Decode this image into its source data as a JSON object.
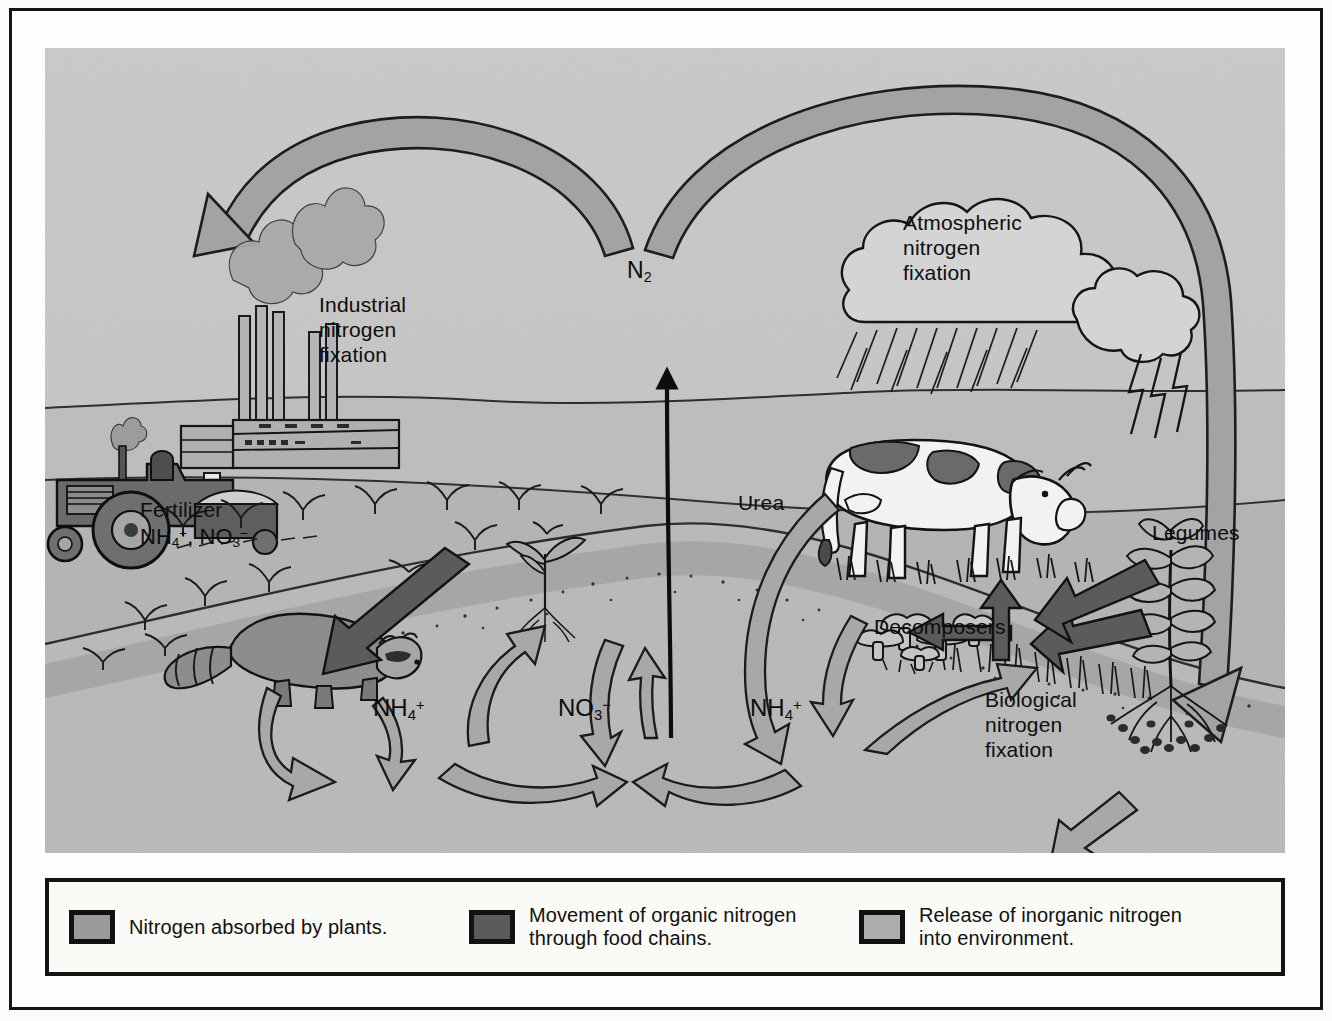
{
  "figure": {
    "type": "diagram"
  },
  "illustration": {
    "labels": {
      "industrial_fixation": "Industrial\nnitrogen\nfixation",
      "atmospheric_fixation": "Atmospheric\nnitrogen\nfixation",
      "biological_fixation": "Biological\nnitrogen\nfixation",
      "fertilizer_title": "Fertilizer",
      "fertilizer_formula_ammonium": "NH",
      "fertilizer_formula_nitrate": "NO",
      "urea": "Urea",
      "legumes": "Legumes",
      "decomposers": "Decomposers",
      "n2": "N",
      "n2_sub": "2",
      "ammonium_left": "NH",
      "ammonium_left_sub": "4",
      "ammonium_left_sup": "+",
      "nitrate_center": "NO",
      "nitrate_center_sub": "3",
      "nitrate_center_sup": "−",
      "ammonium_right": "NH",
      "ammonium_right_sub": "4",
      "ammonium_right_sup": "+"
    },
    "scene_elements": [
      "factory-with-smokestacks",
      "tractor-spreading-fertilizer",
      "raccoon",
      "seedling-plant",
      "grazing-cow",
      "rain-clouds-with-lightning",
      "mushroom-decomposers",
      "legume-plant-with-root-nodules",
      "grass-tufts",
      "soil-layer"
    ],
    "colors": {
      "panel_background": "#b9b9b9",
      "sky": "#c6c6c6",
      "soil_upper": "#b0b0b0",
      "soil_lower": "#bfbfbf",
      "arrow_light": "#a8a8a8",
      "arrow_medium": "#9a9a9a",
      "arrow_dark": "#5b5b5b",
      "outline": "#151515"
    }
  },
  "legend": {
    "items": [
      {
        "swatch": "#9a9a9a",
        "swatch_name": "plants",
        "line1": "Nitrogen absorbed by plants.",
        "line2": ""
      },
      {
        "swatch": "#5b5b5b",
        "swatch_name": "food-chain",
        "line1": "Movement of organic nitrogen",
        "line2": "through food chains."
      },
      {
        "swatch": "#adadad",
        "swatch_name": "release",
        "line1": "Release of inorganic nitrogen",
        "line2": "into environment."
      }
    ]
  }
}
